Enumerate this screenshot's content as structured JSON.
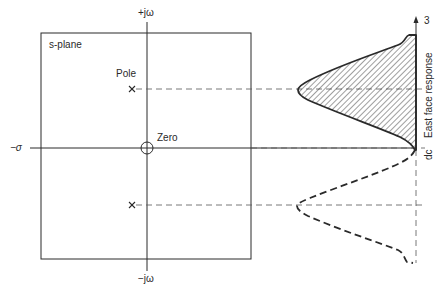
{
  "diagram": {
    "plane_title": "s-plane",
    "axes": {
      "positive_imag": "+jω",
      "negative_imag": "−jω",
      "negative_real": "−σ"
    },
    "markers": {
      "pole_label": "Pole",
      "zero_label": "Zero"
    },
    "response": {
      "axis_label": "East face response",
      "top_tick": "3",
      "dc_label": "dc"
    },
    "colors": {
      "ink": "#2a2a2a",
      "dash": "#555555",
      "background": "#ffffff"
    }
  }
}
